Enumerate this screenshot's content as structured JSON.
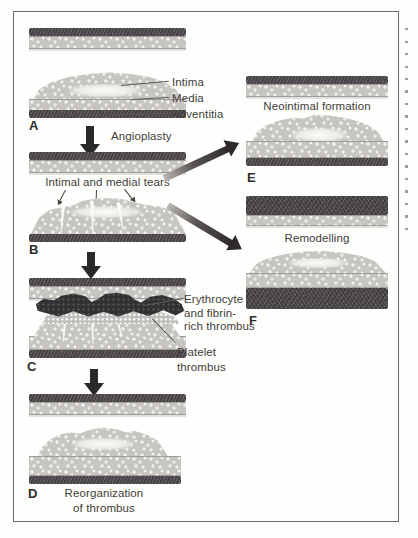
{
  "left_column": {
    "panel_a": {
      "letter": "A",
      "layer_labels": [
        "Intima",
        "Media",
        "Adventitia"
      ]
    },
    "angioplasty_label": "Angioplasty",
    "panel_b": {
      "letter": "B",
      "tears_label": "Intimal and medial tears"
    },
    "panel_c": {
      "letter": "C",
      "erythrocyte_label_lines": [
        "Erythrocyte",
        "and fibrin-",
        "rich thrombus"
      ],
      "platelet_label_lines": [
        "Platelet",
        "thrombus"
      ]
    },
    "panel_d": {
      "letter": "D",
      "caption_lines": [
        "Reorganization",
        "of thrombus"
      ]
    }
  },
  "right_column": {
    "panel_e": {
      "letter": "E",
      "caption": "Neointimal formation"
    },
    "panel_f": {
      "letter": "F",
      "caption": "Remodelling"
    }
  },
  "colors": {
    "frame_border": "#6b6a66",
    "adventitia_band": "#484346",
    "media_pebble": "#c6c5c1",
    "thrombus_dark": "#343134",
    "arrow_dark": "#2b2829",
    "text": "#3f3d3a"
  }
}
